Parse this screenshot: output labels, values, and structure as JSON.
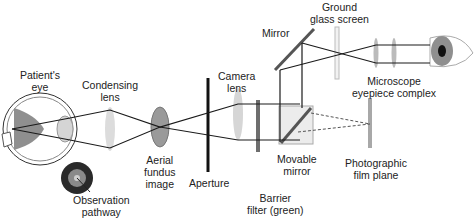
{
  "diagram": {
    "type": "optical-path",
    "labels": {
      "patients_eye": [
        "Patient's",
        "eye"
      ],
      "condensing_lens": [
        "Condensing",
        "lens"
      ],
      "aerial_fundus_image": [
        "Aerial",
        "fundus",
        "image"
      ],
      "aperture": [
        "Aperture"
      ],
      "camera_lens": [
        "Camera",
        "lens"
      ],
      "barrier_filter": [
        "Barrier",
        "filter (green)"
      ],
      "movable_mirror": [
        "Movable",
        "mirror"
      ],
      "mirror": [
        "Mirror"
      ],
      "ground_glass_screen": [
        "Ground",
        "glass screen"
      ],
      "microscope_eyepiece": [
        "Microscope",
        "eyepiece complex"
      ],
      "photographic_film_plane": [
        "Photographic",
        "film plane"
      ],
      "observation_pathway": [
        "Observation",
        "pathway"
      ]
    },
    "colors": {
      "line": "#1a1a1a",
      "lens_fill": "#d9d9d9",
      "filter": "#6e6e6e",
      "mirror": "#555555",
      "box": "#ececec"
    }
  }
}
